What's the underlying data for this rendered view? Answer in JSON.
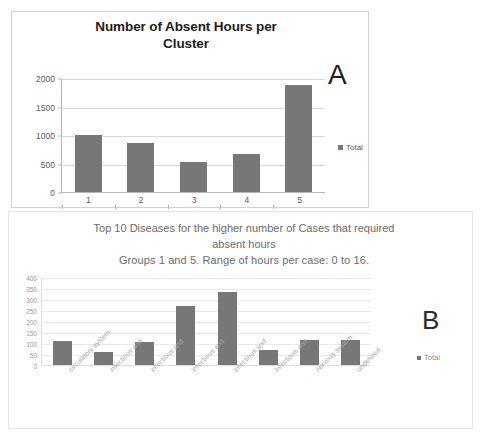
{
  "figure": {
    "background": "#ffffff",
    "bar_color": "#777777"
  },
  "panel_a": {
    "annotation": "A",
    "legend_label": "Total",
    "chart_data": {
      "type": "bar",
      "title": "Number of Absent Hours per Cluster",
      "title_line1": "Number of Absent Hours per",
      "title_line2": "Cluster",
      "categories": [
        "1",
        "2",
        "3",
        "4",
        "5"
      ],
      "values": [
        1000,
        860,
        535,
        670,
        1880
      ],
      "series": [
        {
          "name": "Total",
          "values": [
            1000,
            860,
            535,
            670,
            1880
          ]
        }
      ],
      "xlabel": "",
      "ylabel": "",
      "ylim": [
        0,
        2000
      ],
      "yticks": [
        0,
        500,
        1000,
        1500,
        2000
      ],
      "ytick_labels": [
        "0",
        "500",
        "1000",
        "1500",
        "2000"
      ],
      "grid": true,
      "legend": [
        "Total"
      ],
      "legend_position": "right"
    }
  },
  "panel_b": {
    "annotation": "B",
    "legend_label": "Total",
    "chart_data": {
      "type": "bar",
      "title": "Top 10 Diseases for the higher number of Cases that required absent hours Groups 1 and 5. Range of hours per case: 0 to 16.",
      "title_line1": "Top 10 Diseases for the higher number of Cases that required",
      "title_line2": "absent hours",
      "title_line3": "Groups 1 and 5. Range of hours per case: 0 to 16.",
      "categories": [
        "circulatory system",
        "infectious and",
        "infectious and",
        "infectious and",
        "infectious and",
        "infectious and",
        "nervous system",
        "undefined"
      ],
      "values": [
        110,
        60,
        105,
        270,
        330,
        70,
        112,
        112
      ],
      "series": [
        {
          "name": "Total",
          "values": [
            110,
            60,
            105,
            270,
            330,
            70,
            112,
            112
          ]
        }
      ],
      "xlabel": "",
      "ylabel": "",
      "ylim": [
        0,
        400
      ],
      "yticks": [
        0,
        50,
        100,
        150,
        200,
        250,
        300,
        350,
        400
      ],
      "ytick_labels": [
        "0",
        "50",
        "100",
        "150",
        "200",
        "250",
        "300",
        "350",
        "400"
      ],
      "grid": true,
      "legend": [
        "Total"
      ],
      "legend_position": "right"
    }
  }
}
